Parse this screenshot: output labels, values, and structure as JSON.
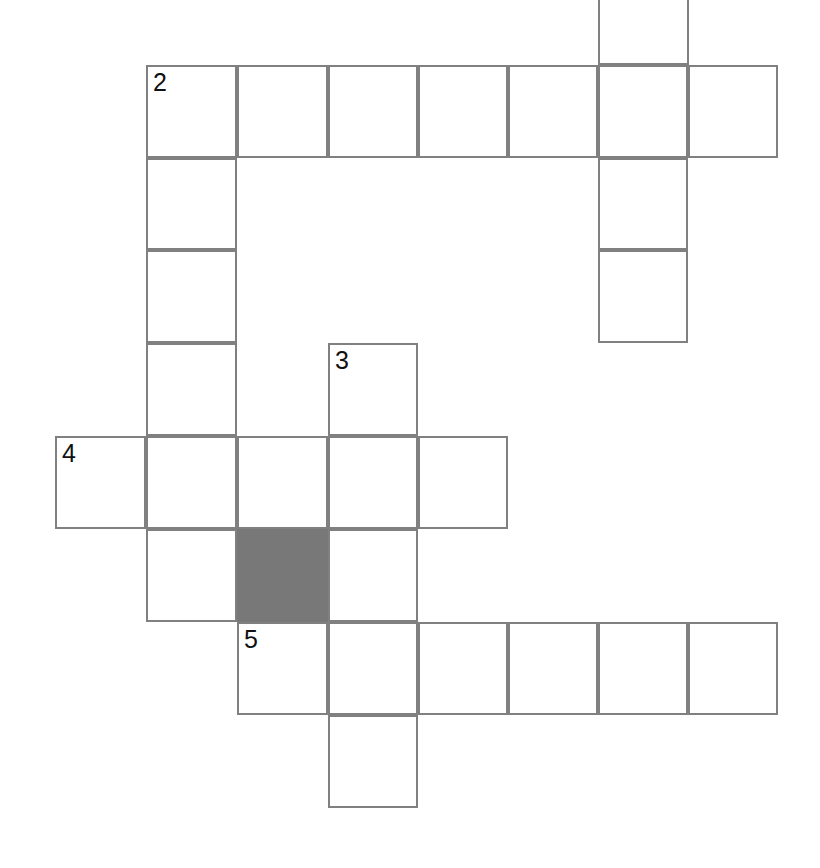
{
  "puzzle": {
    "kind": "crossword-grid",
    "title": "Crossword puzzle grid",
    "canvas": {
      "width": 820,
      "height": 868
    },
    "geometry": {
      "cell_size": 91,
      "row_height": 93,
      "line_color": "#808080",
      "line_width": 2,
      "blocked_fill": "#787878",
      "open_fill": "#ffffff",
      "background": "#ffffff",
      "column_x": [
        55,
        146,
        237,
        328,
        418,
        508,
        598,
        688,
        778
      ],
      "row_y": [
        -28,
        65,
        158,
        250,
        343,
        436,
        529,
        622,
        715,
        808
      ]
    },
    "numbers_visible": [
      "2",
      "3",
      "4",
      "5"
    ],
    "rows": [
      {
        "index": 0,
        "top": -28,
        "height": 93,
        "clipped_at_top": true,
        "cells": [
          {
            "col": 6,
            "x": 598,
            "width": 91,
            "blocked": false,
            "number": "",
            "letter": ""
          }
        ]
      },
      {
        "index": 1,
        "top": 65,
        "height": 93,
        "clipped_at_top": false,
        "cells": [
          {
            "col": 1,
            "x": 146,
            "width": 91,
            "blocked": false,
            "number": "2",
            "letter": ""
          },
          {
            "col": 2,
            "x": 237,
            "width": 91,
            "blocked": false,
            "number": "",
            "letter": ""
          },
          {
            "col": 3,
            "x": 328,
            "width": 90,
            "blocked": false,
            "number": "",
            "letter": ""
          },
          {
            "col": 4,
            "x": 418,
            "width": 90,
            "blocked": false,
            "number": "",
            "letter": ""
          },
          {
            "col": 5,
            "x": 508,
            "width": 90,
            "blocked": false,
            "number": "",
            "letter": ""
          },
          {
            "col": 6,
            "x": 598,
            "width": 90,
            "blocked": false,
            "number": "",
            "letter": ""
          },
          {
            "col": 7,
            "x": 688,
            "width": 90,
            "blocked": false,
            "number": "",
            "letter": ""
          }
        ]
      },
      {
        "index": 2,
        "top": 158,
        "height": 92,
        "clipped_at_top": false,
        "cells": [
          {
            "col": 1,
            "x": 146,
            "width": 91,
            "blocked": false,
            "number": "",
            "letter": ""
          },
          {
            "col": 6,
            "x": 598,
            "width": 90,
            "blocked": false,
            "number": "",
            "letter": ""
          }
        ]
      },
      {
        "index": 3,
        "top": 250,
        "height": 93,
        "clipped_at_top": false,
        "cells": [
          {
            "col": 1,
            "x": 146,
            "width": 91,
            "blocked": false,
            "number": "",
            "letter": ""
          },
          {
            "col": 6,
            "x": 598,
            "width": 90,
            "blocked": false,
            "number": "",
            "letter": ""
          }
        ]
      },
      {
        "index": 4,
        "top": 343,
        "height": 93,
        "clipped_at_top": false,
        "cells": [
          {
            "col": 1,
            "x": 146,
            "width": 91,
            "blocked": false,
            "number": "",
            "letter": ""
          },
          {
            "col": 3,
            "x": 328,
            "width": 90,
            "blocked": false,
            "number": "3",
            "letter": ""
          }
        ]
      },
      {
        "index": 5,
        "top": 436,
        "height": 93,
        "clipped_at_top": false,
        "cells": [
          {
            "col": 0,
            "x": 55,
            "width": 91,
            "blocked": false,
            "number": "4",
            "letter": ""
          },
          {
            "col": 1,
            "x": 146,
            "width": 91,
            "blocked": false,
            "number": "",
            "letter": ""
          },
          {
            "col": 2,
            "x": 237,
            "width": 91,
            "blocked": false,
            "number": "",
            "letter": ""
          },
          {
            "col": 3,
            "x": 328,
            "width": 90,
            "blocked": false,
            "number": "",
            "letter": ""
          },
          {
            "col": 4,
            "x": 418,
            "width": 90,
            "blocked": false,
            "number": "",
            "letter": ""
          }
        ]
      },
      {
        "index": 6,
        "top": 529,
        "height": 93,
        "clipped_at_top": false,
        "cells": [
          {
            "col": 1,
            "x": 146,
            "width": 91,
            "blocked": false,
            "number": "",
            "letter": ""
          },
          {
            "col": 2,
            "x": 237,
            "width": 91,
            "blocked": true,
            "number": "",
            "letter": ""
          },
          {
            "col": 3,
            "x": 328,
            "width": 90,
            "blocked": false,
            "number": "",
            "letter": ""
          }
        ]
      },
      {
        "index": 7,
        "top": 622,
        "height": 93,
        "clipped_at_top": false,
        "cells": [
          {
            "col": 2,
            "x": 237,
            "width": 91,
            "blocked": false,
            "number": "5",
            "letter": ""
          },
          {
            "col": 3,
            "x": 328,
            "width": 90,
            "blocked": false,
            "number": "",
            "letter": ""
          },
          {
            "col": 4,
            "x": 418,
            "width": 90,
            "blocked": false,
            "number": "",
            "letter": ""
          },
          {
            "col": 5,
            "x": 508,
            "width": 90,
            "blocked": false,
            "number": "",
            "letter": ""
          },
          {
            "col": 6,
            "x": 598,
            "width": 90,
            "blocked": false,
            "number": "",
            "letter": ""
          },
          {
            "col": 7,
            "x": 688,
            "width": 90,
            "blocked": false,
            "number": "",
            "letter": ""
          }
        ]
      },
      {
        "index": 8,
        "top": 715,
        "height": 93,
        "clipped_at_top": false,
        "cells": [
          {
            "col": 3,
            "x": 328,
            "width": 90,
            "blocked": false,
            "number": "",
            "letter": ""
          }
        ]
      }
    ]
  }
}
